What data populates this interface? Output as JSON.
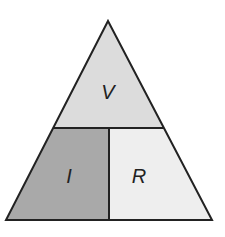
{
  "diagram": {
    "top_label": "V",
    "bottom_left_label": "I",
    "bottom_right_label": "R",
    "colors": {
      "top": "#dcdcdc",
      "bottom_left": "#a9a9a9",
      "bottom_right": "#eeeeee",
      "stroke": "#222222"
    }
  }
}
